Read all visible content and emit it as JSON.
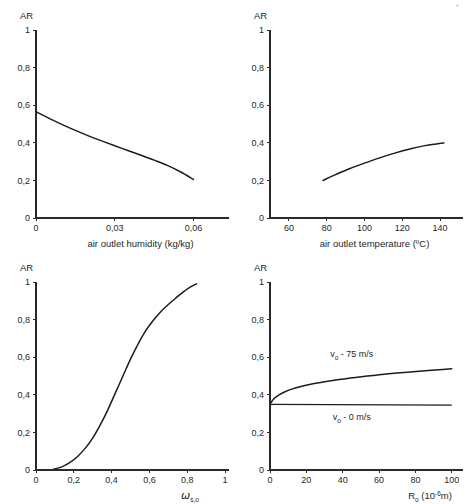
{
  "figure": {
    "background": "#ffffff",
    "ink_color": "#1c1c1c",
    "panel_count": 4
  },
  "chart_data": [
    {
      "id": "air-outlet-humidity",
      "position": "top-left",
      "type": "line",
      "title": "",
      "xlabel": "air outlet humidity (kg/kg)",
      "ylabel": "AR",
      "xlim": [
        0,
        0.072
      ],
      "ylim": [
        0,
        1
      ],
      "xticks": [
        0,
        0.03,
        0.06
      ],
      "xtick_labels": [
        "0",
        "0,03",
        "0,06"
      ],
      "yticks": [
        0,
        0.2,
        0.4,
        0.6,
        0.8,
        1
      ],
      "ytick_labels": [
        "0",
        "0,2",
        "0,4",
        "0,6",
        "0,8",
        "1"
      ],
      "grid": false,
      "legend": "none",
      "series": [
        {
          "name": "AR vs humidity",
          "x": [
            0.0,
            0.005,
            0.01,
            0.015,
            0.02,
            0.025,
            0.03,
            0.035,
            0.04,
            0.045,
            0.05,
            0.055,
            0.06
          ],
          "y": [
            0.565,
            0.53,
            0.497,
            0.466,
            0.437,
            0.41,
            0.384,
            0.359,
            0.334,
            0.308,
            0.28,
            0.246,
            0.205
          ]
        }
      ]
    },
    {
      "id": "air-outlet-temperature",
      "position": "top-right",
      "type": "line",
      "title": "",
      "xlabel": "air outlet temperature (ºC)",
      "ylabel": "AR",
      "xlim": [
        50,
        150
      ],
      "ylim": [
        0,
        1
      ],
      "xticks": [
        60,
        80,
        100,
        120,
        140
      ],
      "xtick_labels": [
        "60",
        "80",
        "100",
        "120",
        "140"
      ],
      "yticks": [
        0,
        0.2,
        0.4,
        0.6,
        0.8,
        1
      ],
      "ytick_labels": [
        "0",
        "0,2",
        "0,4",
        "0,6",
        "0,8",
        "1"
      ],
      "grid": false,
      "legend": "none",
      "series": [
        {
          "name": "AR vs temperature",
          "x": [
            78,
            85,
            92,
            100,
            108,
            116,
            124,
            132,
            138,
            142
          ],
          "y": [
            0.2,
            0.232,
            0.262,
            0.292,
            0.32,
            0.345,
            0.367,
            0.385,
            0.394,
            0.399
          ]
        }
      ]
    },
    {
      "id": "omega-s-o",
      "position": "bottom-left",
      "type": "line",
      "title": "",
      "xlabel": "ω s,o",
      "xlabel_base": "ω",
      "xlabel_sub": "s,o",
      "ylabel": "AR",
      "xlim": [
        0,
        1
      ],
      "ylim": [
        0,
        1
      ],
      "xticks": [
        0,
        0.2,
        0.4,
        0.6,
        0.8,
        1
      ],
      "xtick_labels": [
        "0",
        "0,2",
        "0,4",
        "0,6",
        "0,8",
        "1"
      ],
      "yticks": [
        0,
        0.2,
        0.4,
        0.6,
        0.8,
        1
      ],
      "ytick_labels": [
        "0",
        "0,2",
        "0,4",
        "0,6",
        "0,8",
        "1"
      ],
      "grid": false,
      "legend": "none",
      "series": [
        {
          "name": "AR vs omega_s,o",
          "x": [
            0.095,
            0.14,
            0.18,
            0.22,
            0.26,
            0.3,
            0.34,
            0.38,
            0.42,
            0.46,
            0.5,
            0.54,
            0.58,
            0.62,
            0.66,
            0.7,
            0.74,
            0.78,
            0.82,
            0.85
          ],
          "y": [
            0.005,
            0.018,
            0.04,
            0.072,
            0.115,
            0.17,
            0.24,
            0.32,
            0.41,
            0.5,
            0.59,
            0.67,
            0.74,
            0.795,
            0.842,
            0.88,
            0.915,
            0.948,
            0.975,
            0.99
          ]
        }
      ]
    },
    {
      "id": "droplet-radius",
      "position": "bottom-right",
      "type": "line",
      "title": "",
      "xlabel": "R₀ (10⁻⁶ m)",
      "xlabel_base": "R",
      "xlabel_sub": "o",
      "xlabel_paren_open": "(10",
      "xlabel_exp": "-6",
      "xlabel_paren_close": "m)",
      "ylabel": "AR",
      "xlim": [
        0,
        104
      ],
      "ylim": [
        0,
        1
      ],
      "xticks": [
        0,
        20,
        40,
        60,
        80,
        100
      ],
      "xtick_labels": [
        "0",
        "20",
        "40",
        "60",
        "80",
        "100"
      ],
      "yticks": [
        0,
        0.2,
        0.4,
        0.6,
        0.8,
        1
      ],
      "ytick_labels": [
        "0",
        "0,2",
        "0,4",
        "0,6",
        "0,8",
        "1"
      ],
      "grid": false,
      "legend": "inline-annotations",
      "annotations": [
        {
          "id": "label-v75",
          "text_base": "v",
          "text_sub": "o",
          "text_rest": "- 75 m/s",
          "x": 45,
          "y": 0.6
        },
        {
          "id": "label-v0",
          "text_base": "v",
          "text_sub": "o",
          "text_rest": "- 0 m/s",
          "x": 45,
          "y": 0.265
        }
      ],
      "series": [
        {
          "name": "vo - 75 m/s",
          "label": "v o - 75 m/s",
          "x": [
            0,
            2,
            5,
            8,
            12,
            17,
            23,
            30,
            38,
            47,
            57,
            67,
            77,
            87,
            95,
            100
          ],
          "y": [
            0.35,
            0.378,
            0.4,
            0.415,
            0.43,
            0.444,
            0.457,
            0.469,
            0.481,
            0.492,
            0.503,
            0.513,
            0.521,
            0.529,
            0.535,
            0.539
          ]
        },
        {
          "name": "vo - 0 m/s",
          "label": "v o - 0 m/s",
          "x": [
            0,
            100
          ],
          "y": [
            0.349,
            0.345
          ]
        }
      ]
    }
  ]
}
